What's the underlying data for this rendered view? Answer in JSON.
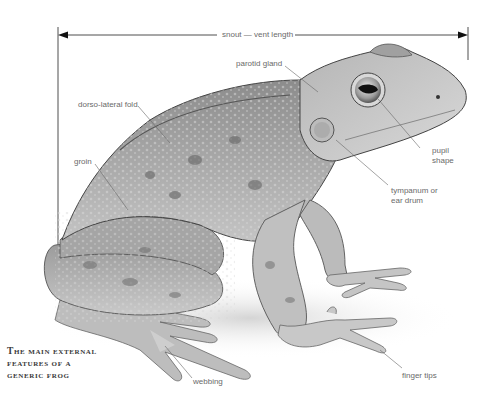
{
  "diagram": {
    "title_lines": [
      "The main external",
      "features of a",
      "generic frog"
    ],
    "measure": {
      "label": "snout — vent length"
    },
    "labels": {
      "parotid_gland": "parotid gland",
      "dorso_lateral_fold": "dorso-lateral fold",
      "groin": "groin",
      "pupil_shape_1": "pupil",
      "pupil_shape_2": "shape",
      "tympanum_1": "tympanum or",
      "tympanum_2": "ear drum",
      "webbing": "webbing",
      "finger_tips": "finger tips"
    },
    "colors": {
      "background": "#ffffff",
      "ink": "#2b2b2b",
      "skin_light": "#cfcfcf",
      "skin_mid": "#9a9a9a",
      "skin_dark": "#5a5a5a",
      "label_text": "#6a6a6a"
    }
  }
}
